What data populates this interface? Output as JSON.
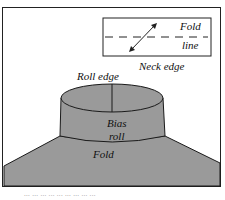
{
  "diagram": {
    "legend": {
      "fold_label_top": "Fold",
      "fold_label_bottom": "line"
    },
    "labels": {
      "neck_edge": "Neck edge",
      "roll_edge": "Roll edge",
      "bias_top": "Bias",
      "bias_bottom": "roll",
      "fold": "Fold"
    },
    "caption": "... ... ... ... ... ... ... ... ..."
  },
  "colors": {
    "fabric": "#9a9a9a",
    "outline": "#1a1a1a",
    "background": "#ffffff"
  }
}
